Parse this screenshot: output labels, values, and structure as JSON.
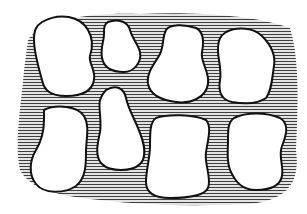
{
  "figure": {
    "background": "#ffffff",
    "ink_color": "#111111",
    "hatch_color": "#2a2a2a",
    "blob_count": 8,
    "rows": 2,
    "columns": 4
  }
}
